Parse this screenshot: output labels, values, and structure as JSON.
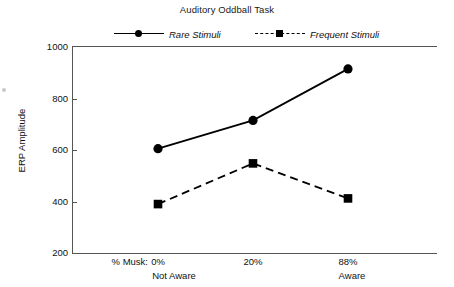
{
  "chart_data": {
    "type": "line",
    "title": "Auditory Oddball Task",
    "xlabel": "",
    "ylabel": "ERP Amplitude",
    "x_prefix_label": "% Musk:",
    "categories": [
      "0%",
      "20%",
      "88%"
    ],
    "group_labels": [
      "Not Aware",
      "Aware"
    ],
    "group_label_positions": [
      0,
      2
    ],
    "series": [
      {
        "name": "Rare Stimuli",
        "values": [
          605,
          715,
          915
        ],
        "marker": "circle",
        "linestyle": "solid"
      },
      {
        "name": "Frequent Stimuli",
        "values": [
          390,
          548,
          412
        ],
        "marker": "square",
        "linestyle": "dashed"
      }
    ],
    "ylim": [
      200,
      1000
    ],
    "yticks": [
      200,
      400,
      600,
      800,
      1000
    ],
    "ytick_labels": [
      "200",
      "400",
      "600",
      "800",
      "1000"
    ],
    "grid": false,
    "legend_position": "top"
  },
  "legend": {
    "entries": [
      {
        "label": "Rare Stimuli"
      },
      {
        "label": "Frequent Stimuli"
      }
    ]
  },
  "colors": {
    "line": "#000000",
    "axis": "#555555",
    "text": "#111111"
  }
}
